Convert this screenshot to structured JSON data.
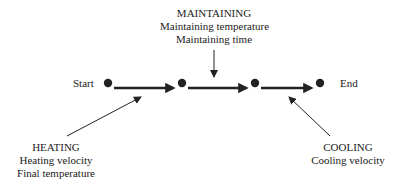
{
  "nodes": {
    "start": {
      "label": "Start"
    },
    "end": {
      "label": "End"
    }
  },
  "stages": {
    "maintaining": {
      "title": "MAINTAINING",
      "lines": [
        "Maintaining temperature",
        "Maintaining time"
      ]
    },
    "heating": {
      "title": "HEATING",
      "lines": [
        "Heating velocity",
        "Final temperature"
      ]
    },
    "cooling": {
      "title": "COOLING",
      "lines": [
        "Cooling velocity"
      ]
    }
  },
  "colors": {
    "line": "#222222",
    "background": "#ffffff"
  }
}
